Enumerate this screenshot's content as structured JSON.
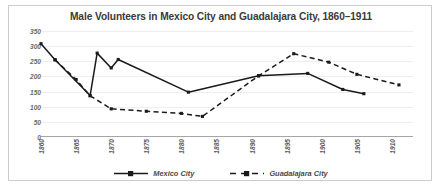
{
  "chart_data": {
    "type": "line",
    "title": "Male Volunteers in Mexico City and Guadalajara City, 1860–1911",
    "xlabel": "",
    "ylabel": "",
    "ylim": [
      0,
      350
    ],
    "ytick_step": 50,
    "yticks": [
      "0",
      "50",
      "100",
      "150",
      "200",
      "250",
      "300",
      "350"
    ],
    "xlim": [
      1860,
      1913
    ],
    "xticks": [
      "1860",
      "1865",
      "1870",
      "1875",
      "1880",
      "1885",
      "1890",
      "1895",
      "1900",
      "1905",
      "1910"
    ],
    "grid": true,
    "legend_position": "bottom",
    "series": [
      {
        "name": "Mexico City",
        "style": "solid",
        "marker": "square",
        "color": "#1a1a1a",
        "points": [
          {
            "x": 1860,
            "y": 308
          },
          {
            "x": 1862,
            "y": 255
          },
          {
            "x": 1867,
            "y": 137
          },
          {
            "x": 1868,
            "y": 277
          },
          {
            "x": 1870,
            "y": 228
          },
          {
            "x": 1871,
            "y": 256
          },
          {
            "x": 1881,
            "y": 148
          },
          {
            "x": 1891,
            "y": 202
          },
          {
            "x": 1898,
            "y": 210
          },
          {
            "x": 1903,
            "y": 157
          },
          {
            "x": 1906,
            "y": 143
          }
        ]
      },
      {
        "name": "Guadalajara City",
        "style": "dashed",
        "marker": "square",
        "color": "#1a1a1a",
        "points": [
          {
            "x": 1862,
            "y": 255
          },
          {
            "x": 1865,
            "y": 190
          },
          {
            "x": 1867,
            "y": 136
          },
          {
            "x": 1870,
            "y": 93
          },
          {
            "x": 1875,
            "y": 85
          },
          {
            "x": 1880,
            "y": 78
          },
          {
            "x": 1883,
            "y": 68
          },
          {
            "x": 1891,
            "y": 202
          },
          {
            "x": 1896,
            "y": 275
          },
          {
            "x": 1901,
            "y": 247
          },
          {
            "x": 1905,
            "y": 207
          },
          {
            "x": 1911,
            "y": 172
          }
        ]
      }
    ]
  },
  "legend": {
    "items": [
      {
        "label": "Mexico City"
      },
      {
        "label": "Guadalajara City"
      }
    ]
  }
}
